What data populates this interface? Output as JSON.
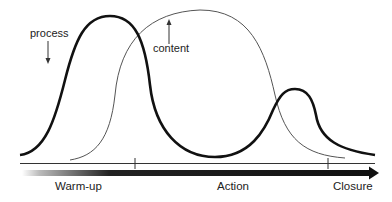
{
  "diagram": {
    "curves": [
      {
        "name": "process",
        "label": "process",
        "style": "thick",
        "color": "#111111",
        "arrow_direction": "down"
      },
      {
        "name": "content",
        "label": "content",
        "style": "thin",
        "color": "#555555",
        "arrow_direction": "up"
      }
    ],
    "timeline": {
      "phases": [
        {
          "label": "Warm-up"
        },
        {
          "label": "Action"
        },
        {
          "label": "Closure"
        }
      ],
      "tick_count": 2,
      "arrow_gradient": [
        "#ffffff",
        "#111111"
      ]
    }
  }
}
